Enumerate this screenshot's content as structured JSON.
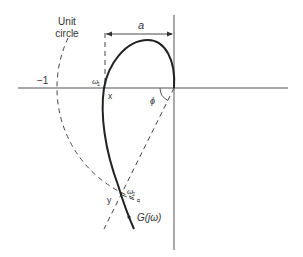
{
  "labels": {
    "unit_circle_line1": "Unit",
    "unit_circle_line2": "circle",
    "minus_one": "−1",
    "a": "a",
    "omega1": "ω",
    "omega1_sub": "1",
    "omega2": "ω",
    "omega2_sub": "2",
    "x_point": "x",
    "y_point": "y",
    "phi": "ϕ",
    "g_label": "G(jω)"
  },
  "colors": {
    "stroke": "#333333",
    "background": "#ffffff"
  }
}
